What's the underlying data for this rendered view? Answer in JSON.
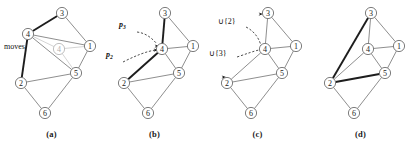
{
  "figure": {
    "width": 413,
    "height": 142,
    "colors": {
      "edge": "#7a7a7a",
      "edge_highlight": "#1d1d1d",
      "edge_ghost": "#c9c9c9",
      "node_stroke": "#6e6e6e",
      "ghost_node": "#b0b0b0",
      "background": "#ffffff",
      "annotation": "#111111"
    },
    "node_ids": [
      "1",
      "2",
      "3",
      "4",
      "5",
      "6"
    ]
  },
  "panels": [
    {
      "key": "a",
      "caption": "(a)",
      "annotation_label": "moves",
      "ghost_node_label": "4",
      "nodes": [
        {
          "id": "3",
          "label": "3",
          "x": 62,
          "y": 13
        },
        {
          "id": "4",
          "label": "4",
          "x": 28,
          "y": 34
        },
        {
          "id": "1",
          "label": "1",
          "x": 90,
          "y": 46
        },
        {
          "id": "5",
          "label": "5",
          "x": 76,
          "y": 73
        },
        {
          "id": "2",
          "label": "2",
          "x": 21,
          "y": 83
        },
        {
          "id": "6",
          "label": "6",
          "x": 45,
          "y": 113
        },
        {
          "id": "g4",
          "label": "4",
          "x": 59,
          "y": 49
        }
      ],
      "edges": [
        {
          "from": "4",
          "to": "3",
          "style": "bold"
        },
        {
          "from": "4",
          "to": "2",
          "style": "bold"
        },
        {
          "from": "3",
          "to": "1",
          "style": "normal"
        },
        {
          "from": "4",
          "to": "1",
          "style": "normal"
        },
        {
          "from": "4",
          "to": "5",
          "style": "normal"
        },
        {
          "from": "1",
          "to": "5",
          "style": "normal"
        },
        {
          "from": "2",
          "to": "5",
          "style": "normal"
        },
        {
          "from": "2",
          "to": "6",
          "style": "normal"
        },
        {
          "from": "5",
          "to": "6",
          "style": "normal"
        },
        {
          "from": "4",
          "to": "g4",
          "style": "faint"
        },
        {
          "from": "g4",
          "to": "1",
          "style": "faint"
        },
        {
          "from": "g4",
          "to": "5",
          "style": "faint"
        }
      ]
    },
    {
      "key": "b",
      "caption": "(b)",
      "annotations": [
        {
          "name": "p3",
          "base": "p",
          "sub": "3",
          "x": 16,
          "y": 27
        },
        {
          "name": "p2",
          "base": "p",
          "sub": "2",
          "x": 3,
          "y": 57
        }
      ],
      "nodes": [
        {
          "id": "3",
          "label": "3",
          "x": 62,
          "y": 13
        },
        {
          "id": "4",
          "label": "4",
          "x": 59,
          "y": 49
        },
        {
          "id": "1",
          "label": "1",
          "x": 90,
          "y": 46
        },
        {
          "id": "5",
          "label": "5",
          "x": 76,
          "y": 73
        },
        {
          "id": "2",
          "label": "2",
          "x": 21,
          "y": 83
        },
        {
          "id": "6",
          "label": "6",
          "x": 45,
          "y": 113
        }
      ],
      "edges": [
        {
          "from": "3",
          "to": "4",
          "style": "bold"
        },
        {
          "from": "4",
          "to": "2",
          "style": "bold"
        },
        {
          "from": "3",
          "to": "1",
          "style": "normal"
        },
        {
          "from": "4",
          "to": "1",
          "style": "normal"
        },
        {
          "from": "4",
          "to": "5",
          "style": "normal"
        },
        {
          "from": "1",
          "to": "5",
          "style": "normal"
        },
        {
          "from": "2",
          "to": "5",
          "style": "normal"
        },
        {
          "from": "2",
          "to": "6",
          "style": "normal"
        },
        {
          "from": "5",
          "to": "6",
          "style": "normal"
        }
      ],
      "pointers": [
        {
          "name": "p3-pointer",
          "path": "M34,32 C42,33 48,37 54,44",
          "tip": [
            56,
            46
          ]
        },
        {
          "name": "p2-pointer",
          "path": "M20,62 C32,56 44,51 53,50",
          "tip": [
            55,
            50
          ]
        }
      ]
    },
    {
      "key": "c",
      "caption": "(c)",
      "annotations": [
        {
          "name": "union-2",
          "text": "∪{2}",
          "x": 12,
          "y": 24
        },
        {
          "name": "union-3",
          "text": "∪{3}",
          "x": 3,
          "y": 56
        }
      ],
      "nodes": [
        {
          "id": "3",
          "label": "3",
          "x": 62,
          "y": 13
        },
        {
          "id": "4",
          "label": "4",
          "x": 59,
          "y": 49
        },
        {
          "id": "1",
          "label": "1",
          "x": 90,
          "y": 46
        },
        {
          "id": "5",
          "label": "5",
          "x": 76,
          "y": 73
        },
        {
          "id": "2",
          "label": "2",
          "x": 21,
          "y": 83
        },
        {
          "id": "6",
          "label": "6",
          "x": 45,
          "y": 113
        }
      ],
      "edges": [
        {
          "from": "3",
          "to": "4",
          "style": "normal"
        },
        {
          "from": "4",
          "to": "2",
          "style": "normal"
        },
        {
          "from": "3",
          "to": "1",
          "style": "normal"
        },
        {
          "from": "4",
          "to": "1",
          "style": "normal"
        },
        {
          "from": "4",
          "to": "5",
          "style": "normal"
        },
        {
          "from": "1",
          "to": "5",
          "style": "normal"
        },
        {
          "from": "2",
          "to": "5",
          "style": "normal"
        },
        {
          "from": "2",
          "to": "6",
          "style": "normal"
        },
        {
          "from": "5",
          "to": "6",
          "style": "normal"
        }
      ],
      "pointers": [
        {
          "name": "union-2-pointer",
          "path": "M40,27 C50,32 54,41 55,46",
          "tip": [
            57,
            14
          ]
        },
        {
          "name": "union-3-pointer",
          "path": "M31,57 C40,54 48,51 53,50",
          "tip": [
            20,
            77
          ]
        }
      ]
    },
    {
      "key": "d",
      "caption": "(d)",
      "nodes": [
        {
          "id": "3",
          "label": "3",
          "x": 62,
          "y": 13
        },
        {
          "id": "4",
          "label": "4",
          "x": 59,
          "y": 49
        },
        {
          "id": "1",
          "label": "1",
          "x": 90,
          "y": 46
        },
        {
          "id": "5",
          "label": "5",
          "x": 76,
          "y": 73
        },
        {
          "id": "2",
          "label": "2",
          "x": 21,
          "y": 83
        },
        {
          "id": "6",
          "label": "6",
          "x": 45,
          "y": 113
        }
      ],
      "edges": [
        {
          "from": "3",
          "to": "4",
          "style": "normal"
        },
        {
          "from": "3",
          "to": "1",
          "style": "normal"
        },
        {
          "from": "3",
          "to": "2",
          "style": "bold"
        },
        {
          "from": "4",
          "to": "1",
          "style": "normal"
        },
        {
          "from": "4",
          "to": "5",
          "style": "normal"
        },
        {
          "from": "4",
          "to": "2",
          "style": "normal"
        },
        {
          "from": "1",
          "to": "5",
          "style": "normal"
        },
        {
          "from": "2",
          "to": "5",
          "style": "bold"
        },
        {
          "from": "2",
          "to": "6",
          "style": "normal"
        },
        {
          "from": "5",
          "to": "6",
          "style": "normal"
        }
      ]
    }
  ]
}
